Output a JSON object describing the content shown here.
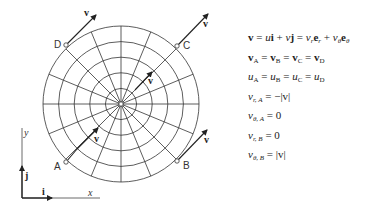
{
  "diagram": {
    "points": [
      {
        "label": "A",
        "x": 66,
        "y": 162
      },
      {
        "label": "B",
        "x": 177,
        "y": 161
      },
      {
        "label": "C",
        "x": 177,
        "y": 46
      },
      {
        "label": "D",
        "x": 66,
        "y": 45
      }
    ],
    "vector_label": "v",
    "axes": {
      "x_label": "x",
      "y_label": "y",
      "i_label": "i",
      "j_label": "j"
    },
    "center": {
      "x": 121,
      "y": 104
    },
    "rings": 5,
    "spokes": 16,
    "colors": {
      "line": "#333333",
      "background": "#ffffff"
    }
  },
  "equations": {
    "eq1": {
      "lhs": "v",
      "mid1": " = ",
      "u": "u",
      "i": "i",
      "plus1": " + ",
      "v2": "v",
      "j": "j",
      "eq": " = ",
      "vr": "v",
      "r": "r",
      "er": "e",
      "er_sub": "r",
      "plus2": " + ",
      "vt": "v",
      "t": "θ",
      "et": "e",
      "et_sub": "θ"
    },
    "eq2": {
      "text_v": "v",
      "subs": [
        "A",
        "B",
        "C",
        "D"
      ],
      "sep": " = "
    },
    "eq3": {
      "text_u": "u",
      "subs": [
        "A",
        "B",
        "C",
        "D"
      ],
      "sep": " = "
    },
    "eq4": {
      "var": "v",
      "sub": "r, A",
      "rhs": " = −|v|"
    },
    "eq5": {
      "var": "v",
      "sub": "θ, A",
      "rhs": " = 0"
    },
    "eq6": {
      "var": "v",
      "sub": "r, B",
      "rhs": " = 0"
    },
    "eq7": {
      "var": "v",
      "sub": "θ, B",
      "rhs": " = |v|"
    }
  }
}
